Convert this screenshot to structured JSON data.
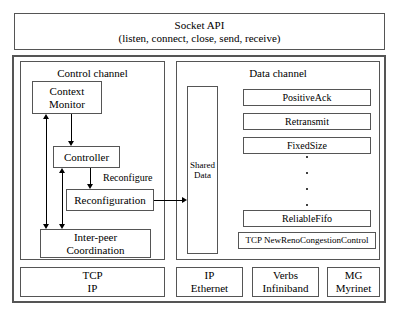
{
  "diagram": {
    "socket_api": {
      "name": "Socket API",
      "calls": "(listen, connect, close, send, receive)"
    },
    "control_channel": {
      "title": "Control channel",
      "nodes": {
        "context_monitor_line1": "Context",
        "context_monitor_line2": "Monitor",
        "controller": "Controller",
        "reconfiguration": "Reconfiguration",
        "inter_peer_line1": "Inter-peer",
        "inter_peer_line2": "Coordination"
      },
      "edge_label": "Reconfigure"
    },
    "data_channel": {
      "title": "Data channel",
      "shared_data_line1": "Shared",
      "shared_data_line2": "Data",
      "modules": [
        "PositiveAck",
        "Retransmit",
        "FixedSize",
        "ReliableFifo",
        "TCP NewRenoCongestionControl"
      ],
      "ellipsis_dots": 4
    },
    "transport_row": [
      {
        "line1": "TCP",
        "line2": "IP"
      },
      {
        "line1": "IP",
        "line2": "Ethernet"
      },
      {
        "line1": "Verbs",
        "line2": "Infiniband"
      },
      {
        "line1": "MG",
        "line2": "Myrinet"
      }
    ],
    "colors": {
      "stroke": "#555555",
      "arrow": "#000000",
      "background": "#ffffff"
    }
  }
}
